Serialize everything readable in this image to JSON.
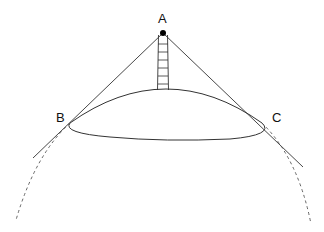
{
  "diagram": {
    "type": "geometry",
    "labels": {
      "A": "A",
      "B": "B",
      "C": "C"
    },
    "points": {
      "A": [
        163,
        33
      ],
      "B": [
        70,
        123
      ],
      "C": [
        262,
        123
      ]
    },
    "colors": {
      "stroke": "#222222",
      "dashed": "#555555",
      "background": "#ffffff"
    }
  }
}
